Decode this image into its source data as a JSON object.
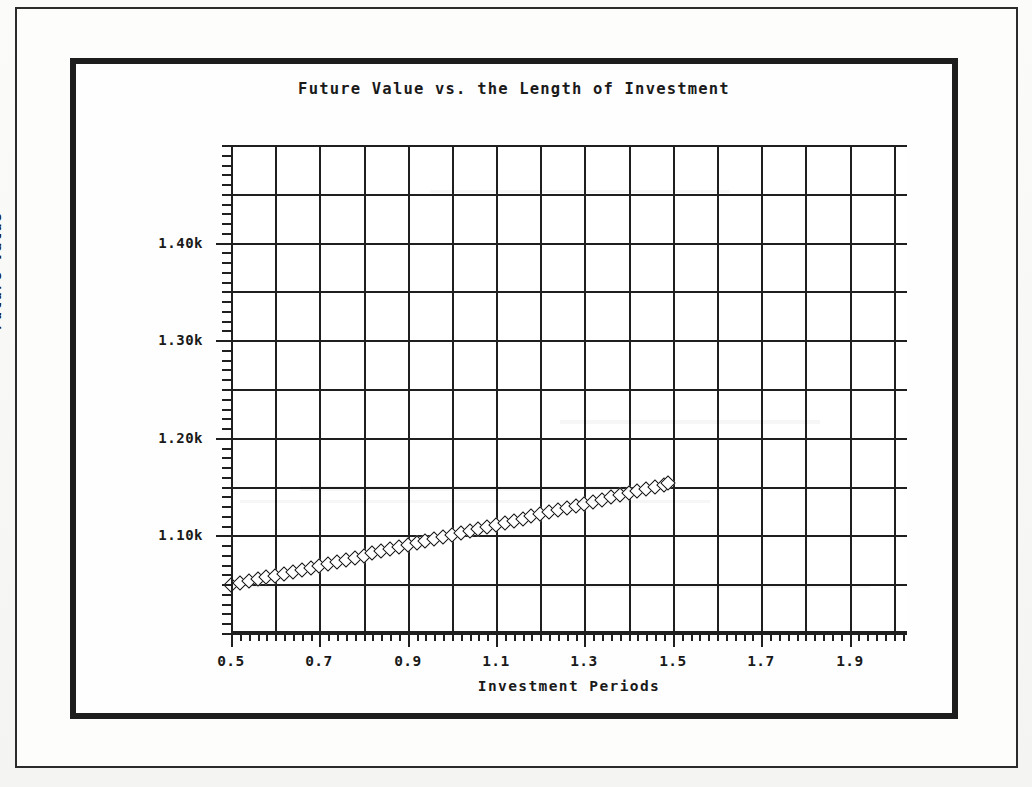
{
  "document": {
    "background_color": "#f2f2f0",
    "paper_color": "#fdfdfc",
    "ink_color": "#1a1a1a"
  },
  "frames": {
    "outer_border_label": "outer-page-border",
    "inner_border_label": "inner-chart-border"
  },
  "chart_data": {
    "type": "scatter",
    "title": "Future Value vs. the Length of Investment",
    "subtitle": "",
    "xlabel": "Investment Periods",
    "ylabel": "Future Value",
    "xlim": [
      0.5,
      2.03
    ],
    "ylim": [
      1.0,
      1.5
    ],
    "grid": true,
    "legend": null,
    "x_major_ticks": [
      0.5,
      0.7,
      0.9,
      1.1,
      1.3,
      1.5,
      1.7,
      1.9
    ],
    "x_major_tick_labels": [
      "0.5",
      "0.7",
      "0.9",
      "1.1",
      "1.3",
      "1.5",
      "1.7",
      "1.9"
    ],
    "x_minor_tick_step": 0.02,
    "x_gridline_step": 0.1,
    "y_major_ticks": [
      1.1,
      1.2,
      1.3,
      1.4
    ],
    "y_major_tick_labels": [
      "1.10k",
      "1.20k",
      "1.30k",
      "1.40k"
    ],
    "y_minor_tick_step": 0.01,
    "y_gridline_step": 0.05,
    "marker_style": "open-diamond",
    "series": [
      {
        "name": "Future Value",
        "formula_hint": "1000 * 1.1^t",
        "x": [
          0.5,
          0.52,
          0.54,
          0.56,
          0.58,
          0.6,
          0.62,
          0.64,
          0.66,
          0.68,
          0.7,
          0.72,
          0.74,
          0.76,
          0.78,
          0.8,
          0.82,
          0.84,
          0.86,
          0.88,
          0.9,
          0.92,
          0.94,
          0.96,
          0.98,
          1.0,
          1.02,
          1.04,
          1.06,
          1.08,
          1.1,
          1.12,
          1.14,
          1.16,
          1.18,
          1.2,
          1.22,
          1.24,
          1.26,
          1.28,
          1.3,
          1.32,
          1.34,
          1.36,
          1.38,
          1.4,
          1.42,
          1.44,
          1.46,
          1.48,
          1.49
        ],
        "y": [
          1.0488,
          1.0508,
          1.0528,
          1.0549,
          1.0569,
          1.0589,
          1.0609,
          1.063,
          1.065,
          1.0671,
          1.0691,
          1.0712,
          1.0732,
          1.0753,
          1.0773,
          1.0794,
          1.0815,
          1.0836,
          1.0856,
          1.0877,
          1.0898,
          1.0919,
          1.094,
          1.0961,
          1.0982,
          1.1003,
          1.1024,
          1.1045,
          1.1066,
          1.1088,
          1.1109,
          1.113,
          1.1152,
          1.1173,
          1.1194,
          1.1216,
          1.1237,
          1.1259,
          1.1281,
          1.1302,
          1.1324,
          1.1346,
          1.1367,
          1.1389,
          1.1411,
          1.1433,
          1.1455,
          1.1477,
          1.1499,
          1.1521,
          1.1532
        ]
      }
    ]
  }
}
